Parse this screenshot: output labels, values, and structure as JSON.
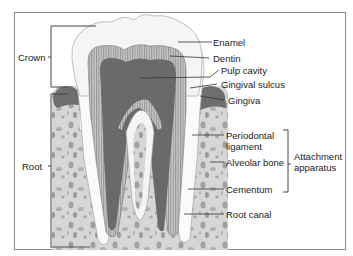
{
  "diagram": {
    "regions": {
      "crown": "Crown",
      "root": "Root"
    },
    "labels": {
      "enamel": "Enamel",
      "dentin": "Dentin",
      "pulp_cavity": "Pulp cavity",
      "gingival_sulcus": "Gingival sulcus",
      "gingiva": "Gingiva",
      "periodontal_ligament_1": "Periodontal",
      "periodontal_ligament_2": "ligament",
      "alveolar_bone": "Alveolar bone",
      "cementum": "Cementum",
      "root_canal": "Root canal"
    },
    "group": {
      "attachment_1": "Attachment",
      "attachment_2": "apparatus"
    },
    "colors": {
      "frame": "#8a8a8a",
      "enamel": "#f6f6f6",
      "dentin": "#b8b8b8",
      "pulp": "#6e6e6e",
      "gingiva": "#707070",
      "bone": "#d2d2d2",
      "bone_spots": "#9c9c9c"
    }
  }
}
